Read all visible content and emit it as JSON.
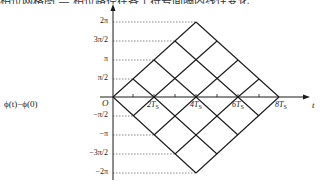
{
  "caption": {
    "text": "相位网格图 — 相位路径在各个符号间隔内线性变化"
  },
  "axes": {
    "y_label": "ϕ(t)−ϕ(0)",
    "x_label": "t",
    "origin_label": "O",
    "y_ticks": [
      {
        "label": "2π",
        "value": 6.2832
      },
      {
        "label": "3π/2",
        "value": 4.7124
      },
      {
        "label": "π",
        "value": 3.1416
      },
      {
        "label": "π/2",
        "value": 1.5708
      },
      {
        "label": "−π/2",
        "value": -1.5708
      },
      {
        "label": "−π",
        "value": -3.1416
      },
      {
        "label": "−3π/2",
        "value": -4.7124
      },
      {
        "label": "−2π",
        "value": -6.2832
      }
    ],
    "x_ticks": [
      {
        "label": "2T",
        "sub": "S",
        "value": 2
      },
      {
        "label": "4T",
        "sub": "S",
        "value": 4
      },
      {
        "label": "6T",
        "sub": "S",
        "value": 6
      },
      {
        "label": "8T",
        "sub": "S",
        "value": 8
      }
    ]
  },
  "colors": {
    "line": "#1a1a1a",
    "dashed": "#555555",
    "text": "#222222"
  }
}
